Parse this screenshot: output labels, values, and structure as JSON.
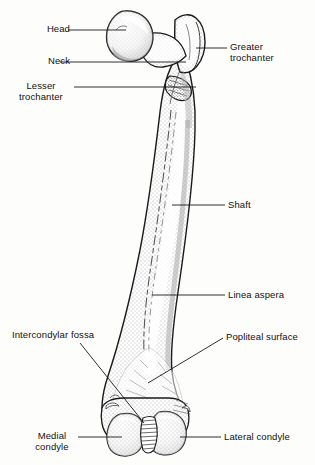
{
  "figure": {
    "view": "posterior",
    "bone": "femur",
    "line_color": "#1a1a1a",
    "fill_color": "#ffffff",
    "shading": "stipple",
    "background": "#fdfdfc"
  },
  "labels": [
    {
      "id": "head",
      "text": "Head",
      "side": "left",
      "x": 30,
      "y": 24,
      "align": "right",
      "width": 40
    },
    {
      "id": "neck",
      "text": "Neck",
      "side": "left",
      "x": 28,
      "y": 56,
      "align": "right",
      "width": 42
    },
    {
      "id": "lesser-trochanter",
      "text": "Lesser\ntrochanter",
      "side": "left",
      "x": 10,
      "y": 81,
      "align": "center",
      "width": 62
    },
    {
      "id": "greater-trochanter",
      "text": "Greater\ntrochanter",
      "side": "right",
      "x": 230,
      "y": 42,
      "align": "left",
      "width": 76
    },
    {
      "id": "shaft",
      "text": "Shaft",
      "side": "right",
      "x": 228,
      "y": 200,
      "align": "left",
      "width": 40
    },
    {
      "id": "linea-aspera",
      "text": "Linea aspera",
      "side": "right",
      "x": 228,
      "y": 290,
      "align": "left",
      "width": 74
    },
    {
      "id": "popliteal-surface",
      "text": "Popliteal surface",
      "side": "right",
      "x": 226,
      "y": 332,
      "align": "left",
      "width": 88
    },
    {
      "id": "intercondylar-fossa",
      "text": "Intercondylar fossa",
      "side": "left",
      "x": 12,
      "y": 330,
      "align": "left",
      "width": 104
    },
    {
      "id": "medial-condyle",
      "text": "Medial\ncondyle",
      "side": "left",
      "x": 28,
      "y": 431,
      "align": "center",
      "width": 48
    },
    {
      "id": "lateral-condyle",
      "text": "Lateral condyle",
      "side": "right",
      "x": 224,
      "y": 432,
      "align": "left",
      "width": 86
    }
  ],
  "leaders": [
    {
      "id": "leader-head",
      "points": "68,30 126,30"
    },
    {
      "id": "leader-neck",
      "points": "60,62 186,62"
    },
    {
      "id": "leader-lesser-trochanter",
      "points": "74,87 196,87"
    },
    {
      "id": "leader-greater-trochanter",
      "points": "196,48 227,48"
    },
    {
      "id": "leader-shaft",
      "points": "172,205 225,205"
    },
    {
      "id": "leader-linea-aspera",
      "points": "152,295 225,295"
    },
    {
      "id": "leader-popliteal-surface",
      "points": "148,383 223,338"
    },
    {
      "id": "leader-intercondylar-fossa",
      "points": "80,343 144,423"
    },
    {
      "id": "leader-medial-condyle",
      "points": "78,437 122,437"
    },
    {
      "id": "leader-lateral-condyle",
      "points": "180,437 221,437"
    }
  ],
  "structures": [
    {
      "id": "femoral-head",
      "name": "Head"
    },
    {
      "id": "femoral-neck",
      "name": "Neck"
    },
    {
      "id": "greater-trochanter",
      "name": "Greater trochanter"
    },
    {
      "id": "lesser-trochanter",
      "name": "Lesser trochanter"
    },
    {
      "id": "femoral-shaft",
      "name": "Shaft"
    },
    {
      "id": "linea-aspera",
      "name": "Linea aspera"
    },
    {
      "id": "popliteal-surface",
      "name": "Popliteal surface"
    },
    {
      "id": "intercondylar-fossa",
      "name": "Intercondylar fossa"
    },
    {
      "id": "medial-condyle",
      "name": "Medial condyle"
    },
    {
      "id": "lateral-condyle",
      "name": "Lateral condyle"
    }
  ]
}
